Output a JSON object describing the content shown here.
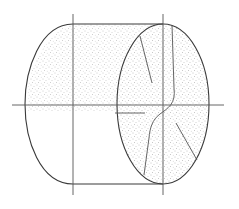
{
  "figure": {
    "colors": {
      "line": "#3a3a3a",
      "stipple": "#9a9a9a",
      "background": "#ffffff"
    }
  }
}
